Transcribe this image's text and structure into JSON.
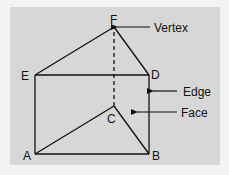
{
  "diagram": {
    "type": "triangular-prism",
    "colors": {
      "page_background": "#f3f3f3",
      "panel_background": "#d7d7d7",
      "stroke": "#111111"
    },
    "vertices": [
      {
        "id": "A",
        "label": "A",
        "x": 35,
        "y": 154
      },
      {
        "id": "B",
        "label": "B",
        "x": 149,
        "y": 154
      },
      {
        "id": "C",
        "label": "C",
        "x": 114,
        "y": 106
      },
      {
        "id": "D",
        "label": "D",
        "x": 149,
        "y": 75
      },
      {
        "id": "E",
        "label": "E",
        "x": 35,
        "y": 75
      },
      {
        "id": "F",
        "label": "F",
        "x": 114,
        "y": 27
      }
    ],
    "edges": [
      {
        "from": "A",
        "to": "B",
        "style": "solid"
      },
      {
        "from": "A",
        "to": "C",
        "style": "solid"
      },
      {
        "from": "C",
        "to": "B",
        "style": "solid"
      },
      {
        "from": "E",
        "to": "D",
        "style": "solid"
      },
      {
        "from": "E",
        "to": "F",
        "style": "solid"
      },
      {
        "from": "F",
        "to": "D",
        "style": "solid"
      },
      {
        "from": "A",
        "to": "E",
        "style": "solid"
      },
      {
        "from": "B",
        "to": "D",
        "style": "solid"
      },
      {
        "from": "C",
        "to": "F",
        "style": "dashed"
      }
    ],
    "annotations": [
      {
        "id": "vertex",
        "text": "Vertex",
        "points_to": "F"
      },
      {
        "id": "edge",
        "text": "Edge",
        "points_to": "edge BD"
      },
      {
        "id": "face",
        "text": "Face",
        "points_to": "face ABDE"
      }
    ]
  }
}
